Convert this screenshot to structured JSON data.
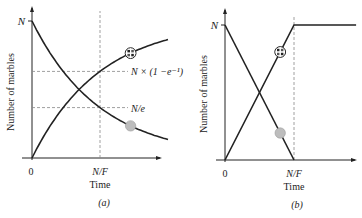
{
  "chart_data": [
    {
      "type": "line",
      "panel_label": "(a)",
      "xlabel": "Time",
      "ylabel": "Number of marbles",
      "x_ticks": [
        "0",
        "N/F"
      ],
      "y_ticks": [
        "N"
      ],
      "reference_lines": [
        {
          "orientation": "horizontal",
          "label": "N × (1 −e⁻¹)",
          "value_fraction_of_N": 0.632
        },
        {
          "orientation": "horizontal",
          "label": "N/e",
          "value_fraction_of_N": 0.368
        },
        {
          "orientation": "vertical",
          "label": "N/F",
          "value_fraction_of_N_over_F": 1.0
        }
      ],
      "series": [
        {
          "name": "decreasing (gray marble)",
          "shape": "exponential decay",
          "x_over_NF": [
            0,
            0.5,
            1.0,
            1.5,
            2.0
          ],
          "y_over_N": [
            1.0,
            0.607,
            0.368,
            0.223,
            0.135
          ],
          "marker": "gray-dot"
        },
        {
          "name": "increasing (patterned marble)",
          "shape": "1 − exponential decay",
          "x_over_NF": [
            0,
            0.5,
            1.0,
            1.5,
            2.0
          ],
          "y_over_N": [
            0.0,
            0.393,
            0.632,
            0.777,
            0.865
          ],
          "marker": "checkered-dot"
        }
      ],
      "xlim_over_NF": [
        0,
        2.1
      ],
      "ylim_over_N": [
        0,
        1.1
      ]
    },
    {
      "type": "line",
      "panel_label": "(b)",
      "xlabel": "Time",
      "ylabel": "Number of marbles",
      "x_ticks": [
        "0",
        "N/F"
      ],
      "y_ticks": [
        "N"
      ],
      "reference_lines": [
        {
          "orientation": "vertical",
          "label": "N/F",
          "value_fraction_of_N_over_F": 1.0
        }
      ],
      "series": [
        {
          "name": "decreasing (gray marble)",
          "shape": "linear",
          "x_over_NF": [
            0,
            1.0
          ],
          "y_over_N": [
            1.0,
            0.0
          ],
          "marker": "gray-dot"
        },
        {
          "name": "increasing (patterned marble)",
          "shape": "linear then flat",
          "x_over_NF": [
            0,
            1.0,
            1.9
          ],
          "y_over_N": [
            0.0,
            1.0,
            1.0
          ],
          "marker": "checkered-dot"
        }
      ],
      "xlim_over_NF": [
        0,
        1.95
      ],
      "ylim_over_N": [
        0,
        1.1
      ]
    }
  ]
}
